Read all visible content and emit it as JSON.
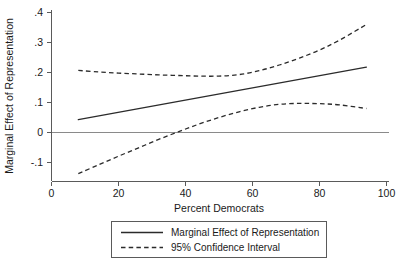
{
  "chart_data": {
    "type": "line",
    "title": "",
    "xlabel": "Percent Democrats",
    "ylabel": "Marginal Effect of Representation",
    "xlim": [
      0,
      100
    ],
    "ylim": [
      -0.1,
      0.4
    ],
    "grid": false,
    "legend_position": "bottom-center",
    "xticks": [
      0,
      20,
      40,
      60,
      80,
      100
    ],
    "xticklabels": [
      "0",
      "20",
      "40",
      "60",
      "80",
      "100"
    ],
    "yticks": [
      -0.1,
      0,
      0.1,
      0.2,
      0.3,
      0.4
    ],
    "yticklabels": [
      "-.1",
      "0",
      ".1",
      ".2",
      ".3",
      ".4"
    ],
    "reference_line": {
      "y": 0,
      "style": "solid"
    },
    "x": [
      8,
      14,
      20,
      26,
      32,
      38,
      44,
      50,
      56,
      62,
      68,
      74,
      80,
      86,
      94
    ],
    "series": [
      {
        "name": "Marginal Effect of Representation",
        "style": "solid",
        "values": [
          0.043,
          0.055,
          0.067,
          0.079,
          0.092,
          0.104,
          0.116,
          0.128,
          0.141,
          0.153,
          0.165,
          0.177,
          0.189,
          0.202,
          0.218
        ]
      },
      {
        "name": "95% Confidence Interval Upper",
        "style": "dashed",
        "values": [
          0.207,
          0.202,
          0.198,
          0.195,
          0.192,
          0.19,
          0.188,
          0.188,
          0.193,
          0.206,
          0.225,
          0.248,
          0.275,
          0.308,
          0.36
        ]
      },
      {
        "name": "95% Confidence Interval Lower",
        "style": "dashed",
        "values": [
          -0.137,
          -0.108,
          -0.079,
          -0.051,
          -0.023,
          0.003,
          0.028,
          0.05,
          0.069,
          0.084,
          0.094,
          0.097,
          0.096,
          0.092,
          0.08
        ]
      }
    ],
    "legend": [
      {
        "label": "Marginal Effect of Representation",
        "style": "solid"
      },
      {
        "label": "95% Confidence Interval",
        "style": "dashed"
      }
    ],
    "colors": {
      "series_line": "#2b2b2b",
      "axis": "#5a5a5a",
      "zero_line": "#8a8a8a",
      "background": "#ffffff"
    }
  }
}
